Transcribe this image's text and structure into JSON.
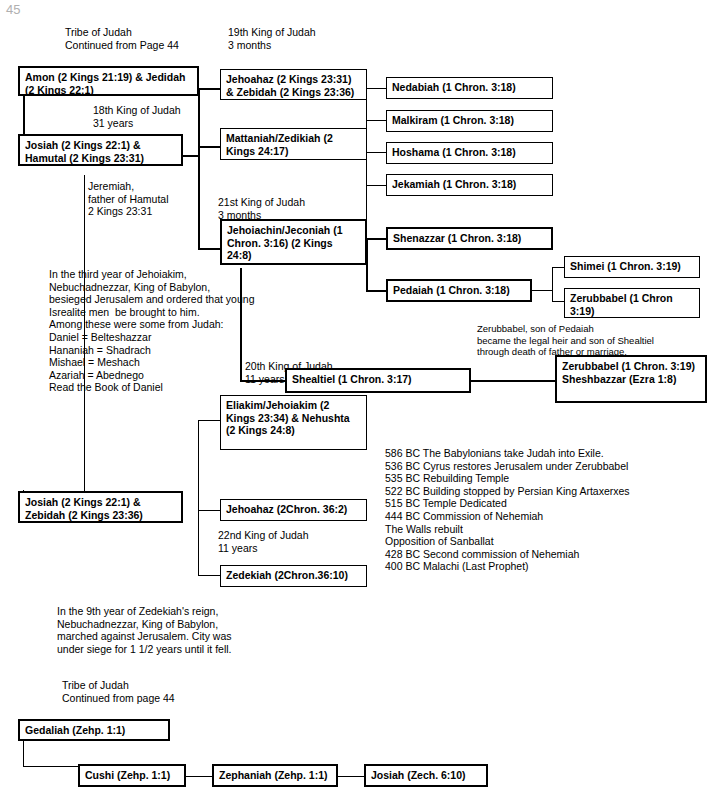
{
  "page": {
    "corner_mark": "45"
  },
  "headers": {
    "tribe_top": "Tribe of Judah\nContinued from Page 44",
    "king19": "19th King of Judah\n3 months",
    "king18": "18th King of Judah\n31 years",
    "king21": "21st King of Judah\n3 months",
    "king20": "20th King of Judah\n11 years",
    "king22": "22nd King of Judah\n11 years",
    "tribe_bottom": "Tribe of Judah\nContinued from page 44"
  },
  "boxes": {
    "amon": "Amon (2 Kings 21:19)\n& Jedidah (2 Kings 22:1)",
    "josiah_hamutal": "Josiah (2 Kings 22:1)\n& Hamutal (2 Kings 23:31)",
    "jehoahaz_zebidah": "Jehoahaz (2 Kings 23:31)\n& Zebidah (2 Kings 23:36)",
    "mattaniah": "Mattaniah/Zedikiah\n(2 Kings 24:17)",
    "jehoiachin": "Jehoiachin/Jeconiah\n(1 Chron. 3:16)\n(2 Kings 24:8)",
    "nedabiah": "Nedabiah (1 Chron. 3:18)",
    "malkiram": "Malkiram (1 Chron. 3:18)",
    "hoshama": "Hoshama (1 Chron. 3:18)",
    "jekamiah": "Jekamiah (1 Chron. 3:18)",
    "shenazzar": "Shenazzar (1 Chron. 3:18)",
    "pedaiah": "Pedaiah (1 Chron. 3:18)",
    "shimei": "Shimei (1 Chron. 3:19)",
    "zerubbabel_small": "Zerubbabel\n(1 Chron 3:19)",
    "shealtiel": "Shealtiel (1 Chron. 3:17)",
    "zerubbabel_big": "Zerubbabel\n(1 Chron. 3:19)\nSheshbazzar (Ezra 1:8)",
    "eliakim": "Eliakim/Jehoiakim\n(2 Kings 23:34)\n& Nehushta\n(2 Kings 24:8)",
    "josiah_zebidah": "Josiah (2 Kings 22:1)\n& Zebidah (2 Kings 23:36)",
    "jehoahaz2": "Jehoahaz (2Chron. 36:2)",
    "zedekiah": "Zedekiah (2Chron.36:10)",
    "gedaliah": "Gedaliah (Zehp. 1:1)",
    "cushi": "Cushi (Zehp. 1:1)",
    "zephaniah": "Zephaniah (Zehp. 1:1)",
    "josiah_zech": "Josiah (Zech. 6:10)"
  },
  "notes": {
    "jeremiah": "Jeremiah,\nfather of Hamutal\n2 Kings 23:31",
    "daniel_block": "In the third year of Jehoiakim,\nNebuchadnezzar, King of Babylon,\nbesieged Jerusalem and ordered that young\nIsrealite men  be brought to him.\nAmong these were some from Judah:\nDaniel = Belteshazzar\nHananiah = Shadrach\nMishael = Meshach\nAzariah = Abednego\nRead the Book of Daniel",
    "zerubbabel_note": "Zerubbabel, son of Pedaiah\nbecame the legal heir and son of Shealtiel\nthrough death of father or marriage.",
    "timeline": "586 BC The Babylonians take Judah into Exile.\n536 BC Cyrus restores Jerusalem under Zerubbabel\n535 BC Rebuilding Temple\n522 BC Building stopped by Persian King Artaxerxes\n515 BC Temple Dedicated\n444 BC Commission of Nehemiah\nThe Walls rebuilt\nOpposition of Sanballat\n428 BC Second commission of Nehemiah\n400 BC Malachi (Last Prophet)",
    "zedekiah_note": "In the 9th year of Zedekiah's reign,\nNebuchadnezzar, King of Babylon,\nmarched against Jerusalem. City was\nunder siege for 1 1/2 years until it fell."
  }
}
